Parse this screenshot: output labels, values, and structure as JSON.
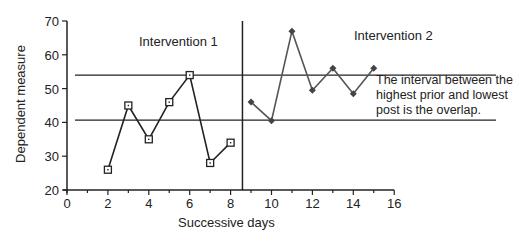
{
  "chart_data": {
    "type": "line",
    "title": "",
    "xlabel": "Successive days",
    "ylabel": "Dependent measure",
    "xlim": [
      0,
      16
    ],
    "ylim": [
      20,
      70
    ],
    "x_ticks": [
      0,
      2,
      4,
      6,
      8,
      10,
      12,
      14,
      16
    ],
    "y_ticks": [
      20,
      30,
      40,
      50,
      60,
      70
    ],
    "grid": false,
    "legend": null,
    "phase_change_x": 8.58,
    "reference_lines": [
      {
        "name": "highest-prior",
        "y": 54
      },
      {
        "name": "lowest-post",
        "y": 40.7
      }
    ],
    "series": [
      {
        "name": "Intervention 1",
        "marker": "open-square",
        "color": "#222222",
        "x": [
          2,
          3,
          4,
          5,
          6,
          7,
          8
        ],
        "values": [
          26,
          45,
          35,
          46,
          54,
          28,
          34
        ]
      },
      {
        "name": "Intervention 2",
        "marker": "diamond",
        "color": "#555555",
        "x": [
          9,
          10,
          11,
          12,
          13,
          14,
          15
        ],
        "values": [
          46,
          40.5,
          67,
          49.5,
          56,
          48.5,
          56
        ]
      }
    ],
    "annotations": [
      {
        "text": "Intervention  1",
        "x": 3.0,
        "y": 65
      },
      {
        "text": "Intervention  2",
        "x": 11.2,
        "y": 66
      },
      {
        "text": "The interval between the highest prior and lowest post is the overlap.",
        "lines": [
          "The interval between the",
          "highest prior and lowest",
          "post is the overlap."
        ],
        "x": 11.0,
        "y": 51
      }
    ]
  },
  "labels": {
    "phase1": "Intervention  1",
    "phase2": "Intervention  2",
    "note_line1": "The interval between the",
    "note_line2": "highest prior and lowest",
    "note_line3": "post is the overlap.",
    "xlabel": "Successive days",
    "ylabel": "Dependent measure"
  }
}
